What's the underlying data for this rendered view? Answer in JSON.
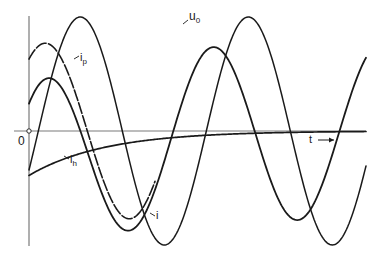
{
  "diagram": {
    "title": "",
    "origin_label": "0",
    "time_axis_label": "t",
    "time_axis_arrow": "arrow-right-icon",
    "curves": [
      {
        "id": "u0",
        "label": "u",
        "subscript": "0",
        "style": "solid",
        "description": "source voltage, sinusoid"
      },
      {
        "id": "i",
        "label": "i",
        "subscript": "",
        "style": "solid",
        "description": "total current = i_p + i_h"
      },
      {
        "id": "ip",
        "label": "i",
        "subscript": "p",
        "style": "dashed",
        "description": "particular (steady-state) current"
      },
      {
        "id": "ih",
        "label": "i",
        "subscript": "h",
        "style": "solid",
        "description": "homogeneous (decaying transient) current"
      }
    ]
  },
  "chart_data": {
    "type": "line",
    "title": "",
    "xlabel": "t",
    "ylabel": "",
    "origin": "0",
    "grid": false,
    "x_range_periods": [
      0,
      2.0
    ],
    "series": [
      {
        "name": "u0",
        "form": "sinusoid",
        "amplitude": 1.0,
        "phase_deg": -20,
        "period": 1.0
      },
      {
        "name": "ip",
        "form": "sinusoid",
        "amplitude": 0.77,
        "phase_deg": 55,
        "period": 1.0
      },
      {
        "name": "ih",
        "form": "exponential_decay",
        "initial_value": -0.39,
        "time_constant_periods": 0.45
      },
      {
        "name": "i",
        "form": "sum",
        "of": [
          "ip",
          "ih"
        ],
        "initial_value": 0.0
      }
    ]
  }
}
